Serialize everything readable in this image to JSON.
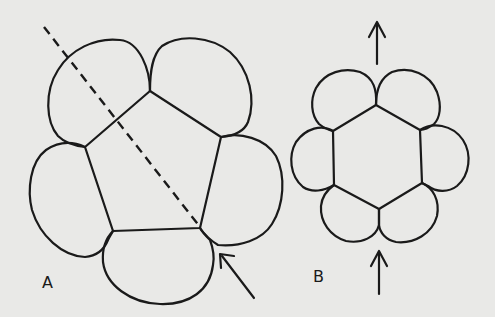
{
  "figure": {
    "panels": [
      {
        "id": "A",
        "label": "A",
        "description": "Five-cell ring surrounding a pentagonal central cell, dashed cleavage line, arrow pointing to junction"
      },
      {
        "id": "B",
        "label": "B",
        "description": "Six-cell ring surrounding a hexagonal central cell, arrows above and below along vertical axis"
      }
    ],
    "colors": {
      "background": "#e9e9e7",
      "ink": "#1a1a1a"
    }
  }
}
